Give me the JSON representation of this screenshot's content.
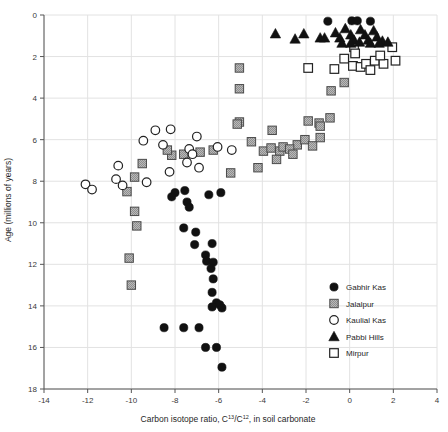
{
  "chart_data": {
    "type": "scatter",
    "title": "",
    "xlabel": "Carbon isotope ratio, C13/C12, in soil carbonate",
    "xlabel_parts": {
      "pre": "Carbon isotope ratio, C",
      "sup1": "13",
      "mid": "/C",
      "sup2": "12",
      "post": ", in soil carbonate"
    },
    "ylabel": "Age (millions of years)",
    "xlim": [
      -14,
      4
    ],
    "ylim": [
      18,
      0
    ],
    "y_inverted": true,
    "xticks": [
      -14,
      -12,
      -10,
      -8,
      -6,
      -4,
      -2,
      0,
      2,
      4
    ],
    "yticks": [
      0,
      2,
      4,
      6,
      8,
      10,
      12,
      14,
      16,
      18
    ],
    "xtick_labels": [
      "-14",
      "-12",
      "-10",
      "-8",
      "-6",
      "-4",
      "-2",
      "0",
      "2",
      "4"
    ],
    "ytick_labels": [
      "0",
      "2",
      "4",
      "6",
      "8",
      "10",
      "12",
      "14",
      "16",
      "18"
    ],
    "grid": true,
    "legend_position": "lower-right",
    "series": [
      {
        "name": "Gabhir Kas",
        "marker": "filled-circle",
        "color": "#111111",
        "points": [
          [
            -1.0,
            0.3
          ],
          [
            0.1,
            0.28
          ],
          [
            0.35,
            0.28
          ],
          [
            0.95,
            0.3
          ],
          [
            -8.0,
            8.55
          ],
          [
            -8.15,
            8.75
          ],
          [
            -7.55,
            8.45
          ],
          [
            -7.45,
            9.0
          ],
          [
            -7.35,
            9.25
          ],
          [
            -6.45,
            8.65
          ],
          [
            -5.9,
            8.55
          ],
          [
            -7.6,
            10.25
          ],
          [
            -7.05,
            10.45
          ],
          [
            -6.3,
            11.0
          ],
          [
            -7.1,
            11.05
          ],
          [
            -6.6,
            11.55
          ],
          [
            -6.55,
            11.85
          ],
          [
            -6.25,
            11.9
          ],
          [
            -6.35,
            12.2
          ],
          [
            -6.25,
            12.7
          ],
          [
            -6.3,
            13.35
          ],
          [
            -6.1,
            13.85
          ],
          [
            -6.3,
            14.05
          ],
          [
            -5.95,
            13.95
          ],
          [
            -5.85,
            14.1
          ],
          [
            -8.5,
            15.05
          ],
          [
            -7.6,
            15.05
          ],
          [
            -6.9,
            15.05
          ],
          [
            -6.6,
            16.0
          ],
          [
            -6.1,
            16.0
          ],
          [
            -5.85,
            16.95
          ]
        ]
      },
      {
        "name": "Jalalpur",
        "marker": "gray-square",
        "color": "#9a9a9a",
        "points": [
          [
            -5.05,
            2.55
          ],
          [
            -5.05,
            3.55
          ],
          [
            -5.05,
            5.15
          ],
          [
            -5.15,
            5.25
          ],
          [
            -3.55,
            5.55
          ],
          [
            -1.9,
            5.1
          ],
          [
            -1.4,
            5.2
          ],
          [
            -1.35,
            5.35
          ],
          [
            -0.85,
            3.65
          ],
          [
            -0.25,
            3.25
          ],
          [
            -2.4,
            6.25
          ],
          [
            -2.05,
            6.0
          ],
          [
            -1.7,
            6.3
          ],
          [
            -1.35,
            5.9
          ],
          [
            -0.9,
            4.95
          ],
          [
            -6.85,
            6.6
          ],
          [
            -6.25,
            6.5
          ],
          [
            -4.5,
            6.1
          ],
          [
            -3.95,
            6.55
          ],
          [
            -3.6,
            6.4
          ],
          [
            -3.2,
            6.55
          ],
          [
            -3.05,
            6.35
          ],
          [
            -2.75,
            6.45
          ],
          [
            -2.6,
            6.7
          ],
          [
            -3.35,
            6.95
          ],
          [
            -8.15,
            6.75
          ],
          [
            -9.5,
            7.15
          ],
          [
            -9.85,
            7.8
          ],
          [
            -10.2,
            8.5
          ],
          [
            -9.85,
            9.45
          ],
          [
            -9.75,
            10.15
          ],
          [
            -10.1,
            11.7
          ],
          [
            -10.0,
            13.0
          ],
          [
            -8.35,
            6.5
          ],
          [
            -7.6,
            6.7
          ],
          [
            -5.45,
            7.6
          ],
          [
            -4.2,
            7.35
          ]
        ]
      },
      {
        "name": "Kaulial Kas",
        "marker": "open-circle",
        "color": "#ffffff",
        "points": [
          [
            -8.9,
            5.55
          ],
          [
            -8.2,
            5.5
          ],
          [
            -7.0,
            5.85
          ],
          [
            -9.45,
            6.05
          ],
          [
            -8.55,
            6.25
          ],
          [
            -7.35,
            6.45
          ],
          [
            -7.2,
            6.7
          ],
          [
            -6.05,
            6.35
          ],
          [
            -5.4,
            6.5
          ],
          [
            -7.45,
            7.1
          ],
          [
            -6.9,
            7.35
          ],
          [
            -10.6,
            7.25
          ],
          [
            -10.7,
            7.9
          ],
          [
            -10.4,
            8.2
          ],
          [
            -9.3,
            8.05
          ],
          [
            -12.1,
            8.15
          ],
          [
            -11.8,
            8.4
          ],
          [
            -8.25,
            7.55
          ]
        ]
      },
      {
        "name": "Pabbi Hills",
        "marker": "filled-triangle",
        "color": "#111111",
        "points": [
          [
            -3.4,
            0.9
          ],
          [
            -2.5,
            1.15
          ],
          [
            -2.1,
            0.9
          ],
          [
            -1.35,
            1.1
          ],
          [
            -1.15,
            1.1
          ],
          [
            -0.65,
            0.85
          ],
          [
            -0.45,
            1.1
          ],
          [
            -0.2,
            0.65
          ],
          [
            0.05,
            0.95
          ],
          [
            0.2,
            1.2
          ],
          [
            0.5,
            0.7
          ],
          [
            0.7,
            0.95
          ],
          [
            0.85,
            1.2
          ],
          [
            1.1,
            0.75
          ],
          [
            1.25,
            1.05
          ],
          [
            1.5,
            1.25
          ],
          [
            0.05,
            1.35
          ],
          [
            0.45,
            1.3
          ],
          [
            0.95,
            1.35
          ],
          [
            1.35,
            1.35
          ],
          [
            1.75,
            1.3
          ],
          [
            -0.35,
            1.35
          ]
        ]
      },
      {
        "name": "Mirpur",
        "marker": "open-square",
        "color": "#ffffff",
        "points": [
          [
            -1.9,
            2.55
          ],
          [
            0.2,
            1.55
          ],
          [
            0.25,
            1.85
          ],
          [
            1.95,
            1.55
          ],
          [
            -0.25,
            2.1
          ],
          [
            0.15,
            2.45
          ],
          [
            0.5,
            2.5
          ],
          [
            0.75,
            2.35
          ],
          [
            1.15,
            2.2
          ],
          [
            1.55,
            2.35
          ],
          [
            -0.7,
            2.6
          ],
          [
            0.95,
            2.65
          ],
          [
            2.1,
            2.2
          ],
          [
            1.4,
            1.95
          ]
        ]
      }
    ]
  },
  "legend": {
    "items": [
      {
        "label": "Gabhir Kas",
        "marker": "filled-circle"
      },
      {
        "label": "Jalalpur",
        "marker": "gray-square"
      },
      {
        "label": "Kaulial Kas",
        "marker": "open-circle"
      },
      {
        "label": "Pabbi Hills",
        "marker": "filled-triangle"
      },
      {
        "label": "Mirpur",
        "marker": "open-square"
      }
    ]
  }
}
